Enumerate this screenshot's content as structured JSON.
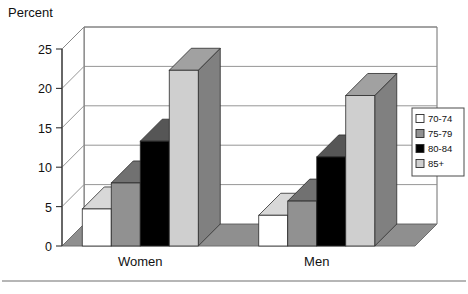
{
  "figure": {
    "axis_title": "Percent",
    "background_color": "#ffffff",
    "separator_rule": true
  },
  "chart_data": {
    "type": "bar",
    "title": "",
    "subtitle": "",
    "xlabel": "",
    "ylabel": "Percent",
    "categories": [
      "Women",
      "Men"
    ],
    "series": [
      {
        "name": "70-74",
        "values": [
          4.7,
          3.9
        ],
        "color": "#ffffff"
      },
      {
        "name": "75-79",
        "values": [
          8.0,
          5.7
        ],
        "color": "#919191"
      },
      {
        "name": "80-84",
        "values": [
          13.3,
          11.3
        ],
        "color": "#000000"
      },
      {
        "name": "85+",
        "values": [
          22.3,
          19.1
        ],
        "color": "#cfcfcf"
      }
    ],
    "ylim": [
      0,
      25
    ],
    "yticks": [
      0,
      5,
      10,
      15,
      20,
      25
    ],
    "ytick_labels": [
      "0",
      "5",
      "10",
      "15",
      "20",
      "25"
    ],
    "grid": true,
    "grid_axis": "y",
    "legend_position": "right",
    "three_d": true
  },
  "legend": {
    "entries": [
      {
        "label": "70-74",
        "swatch": "#ffffff"
      },
      {
        "label": "75-79",
        "swatch": "#919191"
      },
      {
        "label": "80-84",
        "swatch": "#000000"
      },
      {
        "label": "85+",
        "swatch": "#cfcfcf"
      }
    ]
  },
  "axes": {
    "y_ticks": [
      {
        "label": "25"
      },
      {
        "label": "20"
      },
      {
        "label": "15"
      },
      {
        "label": "10"
      },
      {
        "label": "5"
      },
      {
        "label": "0"
      }
    ],
    "x_categories": [
      {
        "label": "Women"
      },
      {
        "label": "Men"
      }
    ]
  },
  "colors": {
    "frame": "#6e6e6e",
    "gridline": "#8a8a8a",
    "bar_front_light": "#cfcfcf",
    "bar_front_mid": "#919191",
    "bar_front_dark": "#000000",
    "bar_front_white": "#ffffff",
    "bar_top_light": "#9b9b9b",
    "bar_side_dark": "#6b6b6b",
    "floor": "#8f8f8f",
    "text": "#111111"
  }
}
